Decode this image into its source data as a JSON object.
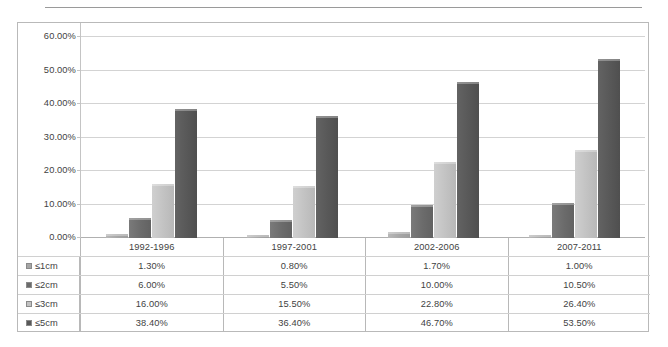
{
  "chart_data": {
    "type": "bar",
    "title": "",
    "subtitle": "",
    "xlabel": "",
    "ylabel": "",
    "ylim": [
      0,
      60
    ],
    "ytick_labels": [
      "0.00%",
      "10.00%",
      "20.00%",
      "30.00%",
      "40.00%",
      "50.00%",
      "60.00%"
    ],
    "ytick_values": [
      0,
      10,
      20,
      30,
      40,
      50,
      60
    ],
    "grid": true,
    "legend_position": "table-left",
    "categories": [
      "1992-1996",
      "1997-2001",
      "2002-2006",
      "2007-2011"
    ],
    "series": [
      {
        "name": "≤1cm",
        "color": "#a6a6a6",
        "values": [
          1.3,
          0.8,
          1.7,
          1.0
        ],
        "labels": [
          "1.30%",
          "0.80%",
          "1.70%",
          "1.00%"
        ]
      },
      {
        "name": "≤2cm",
        "color": "#6b6b6b",
        "values": [
          6.0,
          5.5,
          10.0,
          10.5
        ],
        "labels": [
          "6.00%",
          "5.50%",
          "10.00%",
          "10.50%"
        ]
      },
      {
        "name": "≤3cm",
        "color": "#c2c2c2",
        "values": [
          16.0,
          15.5,
          22.8,
          26.4
        ],
        "labels": [
          "16.00%",
          "15.50%",
          "22.80%",
          "26.40%"
        ]
      },
      {
        "name": "≤5cm",
        "color": "#585858",
        "values": [
          38.4,
          36.4,
          46.7,
          53.5
        ],
        "labels": [
          "38.40%",
          "36.40%",
          "46.70%",
          "53.50%"
        ]
      }
    ]
  }
}
